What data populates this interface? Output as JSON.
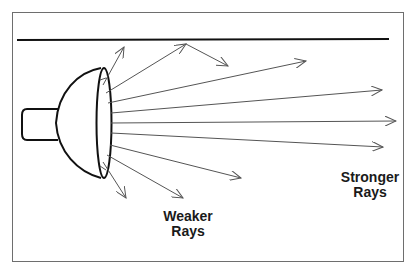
{
  "diagram": {
    "type": "light-source-ray-diagram",
    "colors": {
      "frame": "#6e6e6e",
      "reflector_bar": "#111111",
      "lamp_outline": "#111111",
      "rays": "#555555",
      "text": "#1a1a1a"
    },
    "labels": {
      "weaker": {
        "line1": "Weaker",
        "line2": "Rays"
      },
      "stronger": {
        "line1": "Stronger",
        "line2": "Rays"
      }
    },
    "elements": {
      "lamp": "lamp-icon",
      "reflector": "reflecting-surface",
      "rays_count": 9
    }
  }
}
